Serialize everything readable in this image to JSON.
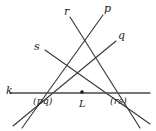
{
  "figure": {
    "background_color": "#ffffff",
    "stroke_color": "#3a3a3a",
    "base_line_color": "#4a4a4a",
    "label_color": "#1b1b1b",
    "width": 156,
    "height": 131
  },
  "labels": {
    "line_k": "k",
    "line_p": "p",
    "line_q": "q",
    "line_r": "r",
    "line_s": "s",
    "point_pq": "(pq)",
    "point_rs": "(rs)",
    "point_L": "L"
  },
  "geometry": {
    "base_line": {
      "name": "k",
      "x1": 10,
      "y1": 93,
      "x2": 150,
      "y2": 93
    },
    "lines": [
      {
        "name": "p",
        "x1": 103,
        "y1": 15,
        "x2": 22,
        "y2": 128
      },
      {
        "name": "q",
        "x1": 116,
        "y1": 41,
        "x2": 13,
        "y2": 126
      },
      {
        "name": "r",
        "x1": 70,
        "y1": 17,
        "x2": 140,
        "y2": 128
      },
      {
        "name": "s",
        "x1": 45,
        "y1": 50,
        "x2": 150,
        "y2": 124
      }
    ],
    "points": [
      {
        "name": "(pq)",
        "x": 45,
        "y": 93
      },
      {
        "name": "L",
        "x": 82,
        "y": 92
      },
      {
        "name": "(rs)",
        "x": 120,
        "y": 93
      }
    ],
    "dot_radius": 1.8
  }
}
